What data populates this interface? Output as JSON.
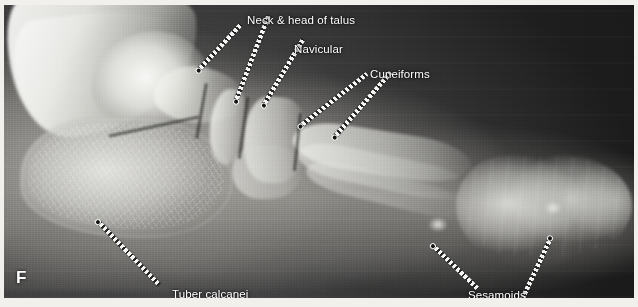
{
  "figure": {
    "letter": "F",
    "kind": "lateral foot radiograph",
    "modality": "X-ray"
  },
  "colors": {
    "label_text": "#ffffff",
    "leader_light": "#f4f4f2",
    "leader_dash": "#141414",
    "film_dark": "#1b1b1b",
    "page_background": "#ffffff"
  },
  "labels": [
    {
      "id": "neck-head-talus",
      "text": "Neck & head of talus",
      "x": 243,
      "y": 9,
      "leaders": [
        {
          "x": 195,
          "y": 62,
          "length": 62,
          "angle": -47
        },
        {
          "x": 232,
          "y": 93,
          "length": 92,
          "angle": -69
        }
      ]
    },
    {
      "id": "navicular",
      "text": "Navicular",
      "x": 290,
      "y": 38,
      "leaders": [
        {
          "x": 260,
          "y": 97,
          "length": 77,
          "angle": -59
        }
      ]
    },
    {
      "id": "cuneiforms",
      "text": "Cuneiforms",
      "x": 366,
      "y": 63,
      "leaders": [
        {
          "x": 297,
          "y": 118,
          "length": 84,
          "angle": -38
        },
        {
          "x": 331,
          "y": 129,
          "length": 85,
          "angle": -49
        }
      ]
    },
    {
      "id": "tuber-calcanei",
      "text": "Tuber calcanei",
      "x": 168,
      "y": 283,
      "leaders": [
        {
          "x": 95,
          "y": 215,
          "length": 87,
          "angle": 46
        }
      ]
    },
    {
      "id": "sesamoids",
      "text": "Sesamoids",
      "x": 464,
      "y": 284,
      "leaders": [
        {
          "x": 430,
          "y": 239,
          "length": 62,
          "angle": 44
        },
        {
          "x": 546,
          "y": 232,
          "length": 64,
          "angle": 115
        }
      ]
    }
  ]
}
